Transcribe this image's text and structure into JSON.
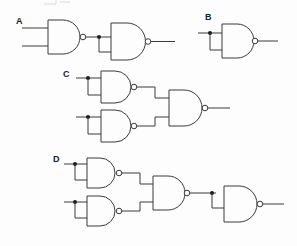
{
  "figure": {
    "background_color": "#fdfdfd",
    "line_color": "#3a3a3a",
    "junction_color": "#1a1a1a",
    "width": 297,
    "height": 246
  },
  "labels": {
    "a": "A",
    "b": "B",
    "c": "C",
    "d": "D"
  },
  "circuits": [
    {
      "id": "A",
      "label": "A",
      "gate_count": 2,
      "gate_type": "NAND",
      "description": "Two-input NAND feeding a second NAND wired as an inverter",
      "inputs": 2,
      "outputs": 1,
      "junctions": 1
    },
    {
      "id": "B",
      "label": "B",
      "gate_count": 1,
      "gate_type": "NAND",
      "description": "Single NAND with both inputs tied together forming an inverter",
      "inputs": 1,
      "outputs": 1,
      "junctions": 1
    },
    {
      "id": "C",
      "label": "C",
      "gate_count": 3,
      "gate_type": "NAND",
      "description": "Two NAND inverters feeding a two-input NAND",
      "inputs": 2,
      "outputs": 1,
      "junctions": 2
    },
    {
      "id": "D",
      "label": "D",
      "gate_count": 4,
      "gate_type": "NAND",
      "description": "Two NAND inverters feeding a NAND, whose output drives a fourth NAND wired as an inverter",
      "inputs": 2,
      "outputs": 1,
      "junctions": 3
    }
  ]
}
